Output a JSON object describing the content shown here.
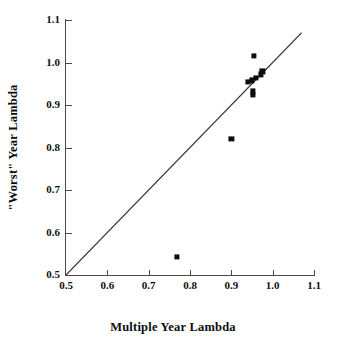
{
  "chart_data": {
    "type": "scatter",
    "title": "",
    "xlabel": "Multiple Year Lambda",
    "ylabel": "\"Worst\" Year Lambda",
    "xlim": [
      0.5,
      1.1
    ],
    "ylim": [
      0.5,
      1.1
    ],
    "xticks": [
      "0.5",
      "0.6",
      "0.7",
      "0.8",
      "0.9",
      "1.0",
      "1.1"
    ],
    "yticks": [
      "0.5",
      "0.6",
      "0.7",
      "0.8",
      "0.9",
      "1.0",
      "1.1"
    ],
    "xtick_values": [
      0.5,
      0.6,
      0.7,
      0.8,
      0.9,
      1.0,
      1.1
    ],
    "ytick_values": [
      0.5,
      0.6,
      0.7,
      0.8,
      0.9,
      1.0,
      1.1
    ],
    "grid": false,
    "legend": null,
    "marker": "filled-square",
    "marker_color": "#0d0d0d",
    "reference_line": {
      "type": "identity",
      "label": "1:1 line",
      "from": [
        0.5,
        0.5
      ],
      "to": [
        1.07,
        1.07
      ],
      "color": "#3a3a3a"
    },
    "points": [
      {
        "x": 0.955,
        "y": 1.015
      },
      {
        "x": 0.975,
        "y": 0.979
      },
      {
        "x": 0.972,
        "y": 0.972
      },
      {
        "x": 0.959,
        "y": 0.963
      },
      {
        "x": 0.95,
        "y": 0.958
      },
      {
        "x": 0.941,
        "y": 0.955
      },
      {
        "x": 0.953,
        "y": 0.932
      },
      {
        "x": 0.952,
        "y": 0.924
      },
      {
        "x": 0.9,
        "y": 0.82
      },
      {
        "x": 0.768,
        "y": 0.543
      }
    ],
    "values": [
      1.015,
      0.979,
      0.972,
      0.963,
      0.958,
      0.955,
      0.932,
      0.924,
      0.82,
      0.543
    ],
    "x": [
      0.955,
      0.975,
      0.972,
      0.959,
      0.95,
      0.941,
      0.953,
      0.952,
      0.9,
      0.768
    ]
  },
  "axes": {
    "x_title": "Multiple Year Lambda",
    "y_title": "\"Worst\" Year Lambda"
  }
}
